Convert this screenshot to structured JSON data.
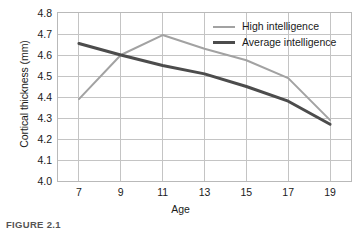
{
  "chart_data": {
    "type": "line",
    "title": "",
    "xlabel": "Age",
    "ylabel": "Cortical thickness (mm)",
    "x": [
      7,
      9,
      11,
      13,
      15,
      17,
      19
    ],
    "xtick_labels": [
      "7",
      "9",
      "11",
      "13",
      "15",
      "17",
      "19"
    ],
    "xlim": [
      6,
      20
    ],
    "ylim": [
      4.0,
      4.8
    ],
    "ytick_labels": [
      "4.0",
      "4.1",
      "4.2",
      "4.3",
      "4.4",
      "4.5",
      "4.6",
      "4.7",
      "4.8"
    ],
    "ytick_values": [
      4.0,
      4.1,
      4.2,
      4.3,
      4.4,
      4.5,
      4.6,
      4.7,
      4.8
    ],
    "grid": true,
    "legend_position": "top-right-inside",
    "series": [
      {
        "name": "High intelligence",
        "color": "#a2a2a2",
        "line_width": 2,
        "values": [
          4.39,
          4.6,
          4.695,
          4.63,
          4.575,
          4.49,
          4.29
        ]
      },
      {
        "name": "Average intelligence",
        "color": "#4c4c4c",
        "line_width": 3,
        "values": [
          4.655,
          4.6,
          4.55,
          4.51,
          4.45,
          4.38,
          4.27
        ]
      }
    ]
  },
  "legend": {
    "items": [
      {
        "label": "High intelligence"
      },
      {
        "label": "Average intelligence"
      }
    ]
  },
  "caption": {
    "text": "FIGURE 2.1"
  },
  "colors": {
    "high_intelligence": "#a2a2a2",
    "average_intelligence": "#4c4c4c",
    "grid": "#c4c4c4",
    "frame": "#b9b9b9",
    "background": "#ffffff"
  }
}
